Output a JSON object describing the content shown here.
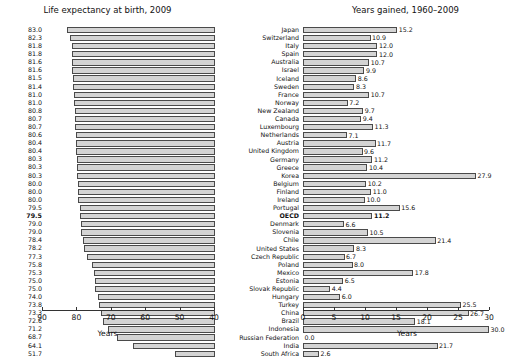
{
  "chart_data": [
    {
      "type": "bar",
      "id": "life-expectancy",
      "title": "Life expectancy at birth, 2009",
      "xlabel": "Years",
      "ylabel": "",
      "orientation": "horizontal",
      "xlim": [
        90,
        40
      ],
      "reversed_axis": true,
      "ticks": [
        90,
        80,
        70,
        60,
        50,
        40
      ],
      "grid": false,
      "legend": "none",
      "categories": [
        "Japan",
        "Switzerland",
        "Italy",
        "Spain",
        "Australia",
        "Israel",
        "Iceland",
        "Sweden",
        "France",
        "Norway",
        "New Zealand",
        "Canada",
        "Luxembourg",
        "Netherlands",
        "Austria",
        "United Kingdom",
        "Germany",
        "Greece",
        "Korea",
        "Belgium",
        "Finland",
        "Ireland",
        "Portugal",
        "OECD",
        "Denmark",
        "Slovenia",
        "Chile",
        "United States",
        "Czech Republic",
        "Poland",
        "Mexico",
        "Estonia",
        "Slovak Republic",
        "Hungary",
        "Turkey",
        "China",
        "Brazil",
        "Indonesia",
        "Russian Federation",
        "India",
        "South Africa"
      ],
      "values": [
        83.0,
        82.3,
        81.8,
        81.8,
        81.6,
        81.6,
        81.5,
        81.4,
        81.0,
        81.0,
        80.8,
        80.7,
        80.7,
        80.6,
        80.4,
        80.4,
        80.3,
        80.3,
        80.3,
        80.0,
        80.0,
        80.0,
        79.5,
        79.5,
        79.0,
        79.0,
        78.4,
        78.2,
        77.3,
        75.8,
        75.3,
        75.0,
        75.0,
        74.0,
        73.8,
        73.3,
        72.6,
        71.2,
        68.7,
        64.1,
        51.7
      ],
      "labels": [
        "83.0",
        "82.3",
        "81.8",
        "81.8",
        "81.6",
        "81.6",
        "81.5",
        "81.4",
        "81.0",
        "81.0",
        "80.8",
        "80.7",
        "80.7",
        "80.6",
        "80.4",
        "80.4",
        "80.3",
        "80.3",
        "80.3",
        "80.0",
        "80.0",
        "80.0",
        "79.5",
        "79.5",
        "79.0",
        "79.0",
        "78.4",
        "78.2",
        "77.3",
        "75.8",
        "75.3",
        "75.0",
        "75.0",
        "74.0",
        "73.8",
        "73.3",
        "72.6",
        "71.2",
        "68.7",
        "64.1",
        "51.7"
      ]
    },
    {
      "type": "bar",
      "id": "years-gained",
      "title": "Years gained, 1960–2009",
      "xlabel": "Years",
      "ylabel": "",
      "orientation": "horizontal",
      "xlim": [
        0,
        30
      ],
      "reversed_axis": false,
      "ticks": [
        0,
        5,
        10,
        15,
        20,
        25,
        30
      ],
      "grid": false,
      "legend": "none",
      "categories": [
        "Japan",
        "Switzerland",
        "Italy",
        "Spain",
        "Australia",
        "Israel",
        "Iceland",
        "Sweden",
        "France",
        "Norway",
        "New Zealand",
        "Canada",
        "Luxembourg",
        "Netherlands",
        "Austria",
        "United Kingdom",
        "Germany",
        "Greece",
        "Korea",
        "Belgium",
        "Finland",
        "Ireland",
        "Portugal",
        "OECD",
        "Denmark",
        "Slovenia",
        "Chile",
        "United States",
        "Czech Republic",
        "Poland",
        "Mexico",
        "Estonia",
        "Slovak Republic",
        "Hungary",
        "Turkey",
        "China",
        "Brazil",
        "Indonesia",
        "Russian Federation",
        "India",
        "South Africa"
      ],
      "values": [
        15.2,
        10.9,
        12.0,
        12.0,
        10.7,
        9.9,
        8.6,
        8.3,
        10.7,
        7.2,
        9.7,
        9.4,
        11.3,
        7.1,
        11.7,
        9.6,
        11.2,
        10.4,
        27.9,
        10.2,
        11.0,
        10.0,
        15.6,
        11.2,
        6.6,
        10.5,
        21.4,
        8.3,
        6.7,
        8.0,
        17.8,
        6.5,
        4.4,
        6.0,
        25.5,
        26.7,
        18.1,
        30.0,
        0.0,
        21.7,
        2.6
      ],
      "labels": [
        "15.2",
        "10.9",
        "12.0",
        "12.0",
        "10.7",
        "9.9",
        "8.6",
        "8.3",
        "10.7",
        "7.2",
        "9.7",
        "9.4",
        "11.3",
        "7.1",
        "11.7",
        "9.6",
        "11.2",
        "10.4",
        "27.9",
        "10.2",
        "11.0",
        "10.0",
        "15.6",
        "11.2",
        "6.6",
        "10.5",
        "21.4",
        "8.3",
        "6.7",
        "8.0",
        "17.8",
        "6.5",
        "4.4",
        "6.0",
        "25.5",
        "26.7",
        "18.1",
        "30.0",
        "0.0",
        "21.7",
        "2.6"
      ]
    }
  ],
  "highlight_row": "OECD",
  "colors": {
    "bar_fill": "#d4d4d4",
    "bar_stroke": "#4a4a4a",
    "text": "#111111",
    "axis": "#333333"
  }
}
